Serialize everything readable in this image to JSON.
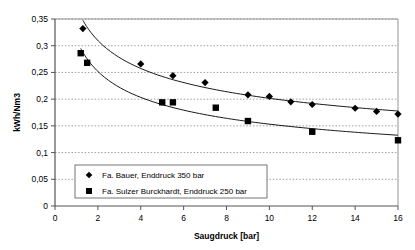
{
  "chart_data": {
    "type": "scatter",
    "title": "",
    "xlabel": "Saugdruck [bar]",
    "ylabel": "kWh/Nm3",
    "xlim": [
      0,
      16
    ],
    "ylim": [
      0,
      0.35
    ],
    "xticks": [
      "0",
      "2",
      "4",
      "6",
      "8",
      "10",
      "12",
      "14",
      "16"
    ],
    "xtick_values": [
      0,
      2,
      4,
      6,
      8,
      10,
      12,
      14,
      16
    ],
    "yticks": [
      "0",
      "0,05",
      "0,1",
      "0,15",
      "0,2",
      "0,25",
      "0,3",
      "0,35"
    ],
    "ytick_values": [
      0,
      0.05,
      0.1,
      0.15,
      0.2,
      0.25,
      0.3,
      0.35
    ],
    "grid": "horizontal-dotted",
    "legend_position": "lower-left-inside",
    "decimal_separator": ",",
    "series": [
      {
        "name": "Fa. Bauer, Enddruck 350 bar",
        "marker": "diamond",
        "color": "#000000",
        "trendline": true,
        "points": [
          {
            "x": 1.3,
            "y": 0.332
          },
          {
            "x": 4.0,
            "y": 0.266
          },
          {
            "x": 5.5,
            "y": 0.244
          },
          {
            "x": 7.0,
            "y": 0.231
          },
          {
            "x": 9.0,
            "y": 0.208
          },
          {
            "x": 10.0,
            "y": 0.205
          },
          {
            "x": 11.0,
            "y": 0.195
          },
          {
            "x": 12.0,
            "y": 0.19
          },
          {
            "x": 14.0,
            "y": 0.183
          },
          {
            "x": 15.0,
            "y": 0.177
          },
          {
            "x": 16.0,
            "y": 0.172
          }
        ]
      },
      {
        "name": "Fa. Sulzer Burckhardt, Enddruck 250 bar",
        "marker": "square",
        "color": "#000000",
        "trendline": true,
        "points": [
          {
            "x": 1.2,
            "y": 0.286
          },
          {
            "x": 1.5,
            "y": 0.268
          },
          {
            "x": 5.0,
            "y": 0.194
          },
          {
            "x": 5.5,
            "y": 0.194
          },
          {
            "x": 7.5,
            "y": 0.184
          },
          {
            "x": 9.0,
            "y": 0.159
          },
          {
            "x": 12.0,
            "y": 0.139
          },
          {
            "x": 16.0,
            "y": 0.123
          }
        ]
      }
    ]
  },
  "legend": {
    "entries": [
      {
        "label": "Fa. Bauer, Enddruck 350 bar",
        "marker": "diamond"
      },
      {
        "label": "Fa. Sulzer Burckhardt, Enddruck 250 bar",
        "marker": "square"
      }
    ]
  }
}
